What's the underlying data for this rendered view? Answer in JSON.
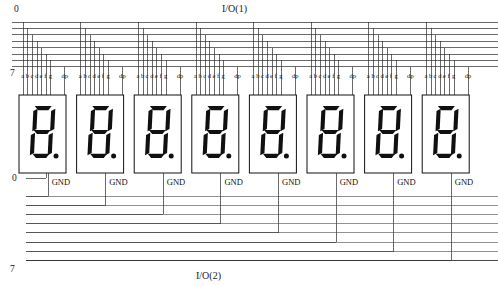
{
  "diagram": {
    "title_top": "I/O(1)",
    "title_bottom": "I/O(2)",
    "top_bus": {
      "first_index": "0",
      "last_index": "7",
      "line_count": 8
    },
    "bottom_bus": {
      "first_index": "0",
      "last_index": "7",
      "line_count": 8
    },
    "pin_labels": [
      "a",
      "b",
      "c",
      "d",
      "e",
      "f",
      "g"
    ],
    "dp_label": "dp",
    "gnd_label": "GND",
    "display_count": 8,
    "segments_on": [
      "a",
      "b",
      "c",
      "d",
      "e",
      "f",
      "g",
      "dp"
    ],
    "colors": {
      "wire": "#2b2b2b",
      "segment": "#101010",
      "background": "#ffffff",
      "outline": "#111111"
    }
  }
}
